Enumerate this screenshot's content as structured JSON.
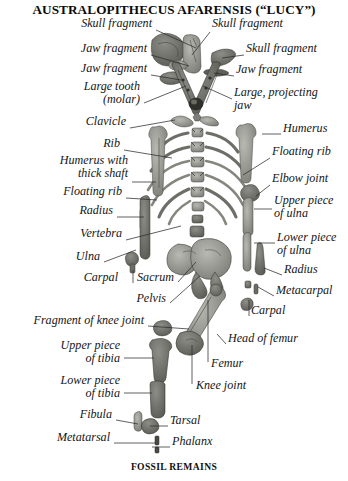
{
  "figure": {
    "title": "AUSTRALOPITHECUS AFARENSIS (“LUCY”)",
    "caption": "FOSSIL REMAINS",
    "background_color": "#ffffff",
    "bone_color": "#9a9a96",
    "line_color": "#2b2b2b",
    "text_color": "#151515"
  },
  "labels_left": [
    {
      "id": "skull-fragment-1",
      "text": "Skull fragment",
      "x": 152,
      "y": 26,
      "align": "right"
    },
    {
      "id": "jaw-fragment-1",
      "text": "Jaw fragment",
      "x": 147,
      "y": 51,
      "align": "right"
    },
    {
      "id": "jaw-fragment-2",
      "text": "Jaw fragment",
      "x": 147,
      "y": 71,
      "align": "right"
    },
    {
      "id": "large-tooth-molar",
      "text": "Large tooth\n(molar)",
      "x": 140,
      "y": 89,
      "align": "right"
    },
    {
      "id": "clavicle",
      "text": "Clavicle",
      "x": 126,
      "y": 124,
      "align": "right"
    },
    {
      "id": "rib",
      "text": "Rib",
      "x": 120,
      "y": 146,
      "align": "right"
    },
    {
      "id": "humerus-thick-shaft",
      "text": "Humerus with\nthick shaft",
      "x": 128,
      "y": 163,
      "align": "right"
    },
    {
      "id": "floating-rib-left",
      "text": "Floating rib",
      "x": 122,
      "y": 194,
      "align": "right"
    },
    {
      "id": "radius-left",
      "text": "Radius",
      "x": 113,
      "y": 213,
      "align": "right"
    },
    {
      "id": "vertebra",
      "text": "Vertebra",
      "x": 122,
      "y": 236,
      "align": "right"
    },
    {
      "id": "ulna-left",
      "text": "Ulna",
      "x": 100,
      "y": 259,
      "align": "right"
    },
    {
      "id": "carpal-left",
      "text": "Carpal",
      "x": 118,
      "y": 280,
      "align": "right"
    },
    {
      "id": "sacrum",
      "text": "Sacrum",
      "x": 174,
      "y": 280,
      "align": "right"
    },
    {
      "id": "pelvis",
      "text": "Pelvis",
      "x": 166,
      "y": 301,
      "align": "right"
    },
    {
      "id": "fragment-of-knee-joint",
      "text": "Fragment of knee joint",
      "x": 144,
      "y": 323,
      "align": "right"
    },
    {
      "id": "upper-piece-of-tibia",
      "text": "Upper piece\nof tibia",
      "x": 120,
      "y": 348,
      "align": "right"
    },
    {
      "id": "lower-piece-of-tibia",
      "text": "Lower piece\nof tibia",
      "x": 120,
      "y": 383,
      "align": "right"
    },
    {
      "id": "fibula",
      "text": "Fibula",
      "x": 112,
      "y": 417,
      "align": "right"
    },
    {
      "id": "metatarsal",
      "text": "Metatarsal",
      "x": 110,
      "y": 440,
      "align": "right"
    }
  ],
  "labels_right": [
    {
      "id": "skull-fragment-2",
      "text": "Skull fragment",
      "x": 212,
      "y": 26,
      "align": "left"
    },
    {
      "id": "skull-fragment-3",
      "text": "Skull fragment",
      "x": 246,
      "y": 51,
      "align": "left"
    },
    {
      "id": "jaw-fragment-3",
      "text": "Jaw fragment",
      "x": 236,
      "y": 72,
      "align": "left"
    },
    {
      "id": "large-projecting-jaw",
      "text": "Large, projecting\njaw",
      "x": 234,
      "y": 95,
      "align": "left"
    },
    {
      "id": "humerus-right",
      "text": "Humerus",
      "x": 283,
      "y": 131,
      "align": "left"
    },
    {
      "id": "floating-rib-right",
      "text": "Floating rib",
      "x": 272,
      "y": 154,
      "align": "left"
    },
    {
      "id": "elbow-joint",
      "text": "Elbow joint",
      "x": 272,
      "y": 181,
      "align": "left"
    },
    {
      "id": "upper-piece-of-ulna",
      "text": "Upper piece\nof ulna",
      "x": 274,
      "y": 203,
      "align": "left"
    },
    {
      "id": "lower-piece-of-ulna",
      "text": "Lower piece\nof ulna",
      "x": 277,
      "y": 240,
      "align": "left"
    },
    {
      "id": "radius-right",
      "text": "Radius",
      "x": 284,
      "y": 272,
      "align": "left"
    },
    {
      "id": "metacarpal",
      "text": "Metacarpal",
      "x": 276,
      "y": 293,
      "align": "left"
    },
    {
      "id": "carpal-right",
      "text": "Carpal",
      "x": 251,
      "y": 313,
      "align": "left"
    },
    {
      "id": "head-of-femur",
      "text": "Head of femur",
      "x": 228,
      "y": 341,
      "align": "left"
    },
    {
      "id": "femur",
      "text": "Femur",
      "x": 211,
      "y": 366,
      "align": "left"
    },
    {
      "id": "knee-joint",
      "text": "Knee joint",
      "x": 196,
      "y": 388,
      "align": "left"
    },
    {
      "id": "tarsal",
      "text": "Tarsal",
      "x": 170,
      "y": 423,
      "align": "left"
    },
    {
      "id": "phalanx",
      "text": "Phalanx",
      "x": 172,
      "y": 444,
      "align": "left"
    }
  ],
  "leaders": [
    {
      "from": "skull-fragment-1",
      "x1": 156,
      "y1": 30,
      "x2": 196,
      "y2": 48
    },
    {
      "from": "jaw-fragment-1",
      "x1": 151,
      "y1": 55,
      "x2": 189,
      "y2": 66
    },
    {
      "from": "jaw-fragment-2",
      "x1": 151,
      "y1": 75,
      "x2": 181,
      "y2": 80
    },
    {
      "from": "large-tooth-molar",
      "x1": 144,
      "y1": 103,
      "x2": 186,
      "y2": 86
    },
    {
      "from": "clavicle",
      "x1": 130,
      "y1": 128,
      "x2": 175,
      "y2": 120
    },
    {
      "from": "rib",
      "x1": 124,
      "y1": 150,
      "x2": 172,
      "y2": 158
    },
    {
      "from": "humerus-thick-shaft",
      "x1": 132,
      "y1": 182,
      "x2": 156,
      "y2": 182
    },
    {
      "from": "floating-rib-left",
      "x1": 126,
      "y1": 198,
      "x2": 157,
      "y2": 200
    },
    {
      "from": "radius-left",
      "x1": 117,
      "y1": 217,
      "x2": 144,
      "y2": 217
    },
    {
      "from": "vertebra",
      "x1": 126,
      "y1": 240,
      "x2": 181,
      "y2": 226
    },
    {
      "from": "ulna-left",
      "x1": 104,
      "y1": 262,
      "x2": 136,
      "y2": 250
    },
    {
      "from": "sacrum",
      "x1": 178,
      "y1": 282,
      "x2": 196,
      "y2": 262
    },
    {
      "from": "pelvis",
      "x1": 170,
      "y1": 303,
      "x2": 200,
      "y2": 276
    },
    {
      "from": "fragment-of-knee-joint",
      "x1": 148,
      "y1": 326,
      "x2": 189,
      "y2": 329
    },
    {
      "from": "upper-piece-of-tibia",
      "x1": 124,
      "y1": 358,
      "x2": 154,
      "y2": 358
    },
    {
      "from": "lower-piece-of-tibia",
      "x1": 124,
      "y1": 393,
      "x2": 152,
      "y2": 393
    },
    {
      "from": "fibula",
      "x1": 116,
      "y1": 420,
      "x2": 138,
      "y2": 424
    },
    {
      "from": "metatarsal",
      "x1": 114,
      "y1": 443,
      "x2": 156,
      "y2": 443
    },
    {
      "from": "skull-fragment-2",
      "x1": 210,
      "y1": 32,
      "x2": 192,
      "y2": 55
    },
    {
      "from": "skull-fragment-3",
      "x1": 244,
      "y1": 55,
      "x2": 222,
      "y2": 58
    },
    {
      "from": "jaw-fragment-3",
      "x1": 234,
      "y1": 76,
      "x2": 214,
      "y2": 73
    },
    {
      "from": "large-projecting-jaw",
      "x1": 232,
      "y1": 99,
      "x2": 203,
      "y2": 86
    },
    {
      "from": "humerus-right",
      "x1": 281,
      "y1": 134,
      "x2": 262,
      "y2": 134
    },
    {
      "from": "floating-rib-right",
      "x1": 270,
      "y1": 158,
      "x2": 243,
      "y2": 175
    },
    {
      "from": "elbow-joint",
      "x1": 270,
      "y1": 185,
      "x2": 256,
      "y2": 196
    },
    {
      "from": "upper-piece-of-ulna",
      "x1": 272,
      "y1": 209,
      "x2": 254,
      "y2": 209
    },
    {
      "from": "lower-piece-of-ulna",
      "x1": 275,
      "y1": 243,
      "x2": 254,
      "y2": 243
    },
    {
      "from": "radius-right",
      "x1": 282,
      "y1": 275,
      "x2": 264,
      "y2": 268
    },
    {
      "from": "metacarpal",
      "x1": 274,
      "y1": 296,
      "x2": 258,
      "y2": 287
    },
    {
      "from": "head-of-femur",
      "x1": 226,
      "y1": 344,
      "x2": 217,
      "y2": 334
    },
    {
      "from": "femur",
      "x1": 208,
      "y1": 362,
      "x2": 208,
      "y2": 300
    },
    {
      "from": "knee-joint",
      "x1": 192,
      "y1": 384,
      "x2": 192,
      "y2": 345
    },
    {
      "from": "tarsal",
      "x1": 168,
      "y1": 426,
      "x2": 150,
      "y2": 426
    },
    {
      "from": "phalanx",
      "x1": 170,
      "y1": 447,
      "x2": 152,
      "y2": 447
    },
    {
      "from": "carpal-right",
      "x1": 249,
      "y1": 300,
      "x2": 249,
      "y2": 316
    },
    {
      "from": "carpal-left",
      "x1": 133,
      "y1": 270,
      "x2": 133,
      "y2": 283
    }
  ]
}
